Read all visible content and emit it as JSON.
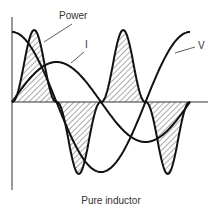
{
  "diagram": {
    "title": "Pure inductor",
    "labels": {
      "power": "Power",
      "current": "I",
      "voltage": "V"
    },
    "colors": {
      "stroke": "#111111",
      "hatch": "#444444",
      "background": "#ffffff",
      "text": "#333333"
    },
    "geometry": {
      "axis_x_px": 12,
      "axis_y_px": 102,
      "period_px": 178,
      "x_start_px": 12,
      "x_end_px": 190
    }
  },
  "chart_data": {
    "type": "line",
    "title": "Pure inductor",
    "xlabel": "",
    "ylabel": "",
    "series": [
      {
        "name": "V",
        "description": "voltage, leads current by 90 degrees (cosine)",
        "phase_deg": 90,
        "amplitude": 1.0
      },
      {
        "name": "I",
        "description": "current (sine)",
        "phase_deg": 0,
        "amplitude": 0.55
      },
      {
        "name": "Power",
        "description": "instantaneous power V*I at twice the frequency, hatched; average zero",
        "phase_deg": 0,
        "amplitude": 1.0
      }
    ],
    "x_range_cycles": [
      0,
      1
    ],
    "grid": false,
    "annotations": [
      "Power",
      "I",
      "V"
    ]
  }
}
